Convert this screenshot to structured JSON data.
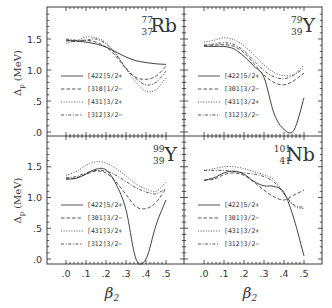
{
  "chart_data": [
    {
      "type": "line",
      "panel": "top-left",
      "title": "77 37 Rb",
      "nucleus": {
        "mass": "77",
        "z": "37",
        "symbol": "Rb"
      },
      "xlabel": "β2",
      "ylabel": "Δp (MeV)",
      "xlim": [
        0.0,
        0.5
      ],
      "ylim": [
        0.0,
        1.5
      ],
      "x": [
        0.0,
        0.05,
        0.1,
        0.15,
        0.2,
        0.25,
        0.3,
        0.35,
        0.4,
        0.45,
        0.5
      ],
      "series": [
        {
          "name": "[422]5/2+",
          "style": "solid",
          "values": [
            1.48,
            1.47,
            1.45,
            1.42,
            1.37,
            1.29,
            1.21,
            1.15,
            1.12,
            1.1,
            1.09
          ]
        },
        {
          "name": "[310]1/2−",
          "style": "dashed",
          "values": [
            1.47,
            1.46,
            1.48,
            1.45,
            1.37,
            1.22,
            1.02,
            0.88,
            0.85,
            0.9,
            1.06
          ]
        },
        {
          "name": "[431]3/2+",
          "style": "dotted",
          "values": [
            1.43,
            1.47,
            1.53,
            1.52,
            1.44,
            1.26,
            1.02,
            0.8,
            0.66,
            0.68,
            0.88
          ]
        },
        {
          "name": "[312]3/2−",
          "style": "dashdot",
          "values": [
            1.5,
            1.48,
            1.48,
            1.5,
            1.42,
            1.25,
            1.03,
            0.86,
            0.76,
            0.8,
            0.98
          ]
        }
      ]
    },
    {
      "type": "line",
      "panel": "top-right",
      "title": "79 39 Y",
      "nucleus": {
        "mass": "79",
        "z": "39",
        "symbol": "Y"
      },
      "xlabel": "β2",
      "ylabel": "Δp (MeV)",
      "xlim": [
        0.0,
        0.5
      ],
      "ylim": [
        0.0,
        1.5
      ],
      "x": [
        0.0,
        0.05,
        0.1,
        0.15,
        0.2,
        0.25,
        0.3,
        0.35,
        0.4,
        0.45,
        0.5
      ],
      "series": [
        {
          "name": "[422]5/2+",
          "style": "solid",
          "values": [
            1.38,
            1.38,
            1.38,
            1.34,
            1.22,
            1.06,
            0.88,
            0.3,
            0.04,
            0.03,
            0.55
          ]
        },
        {
          "name": "[301]3/2−",
          "style": "dashed",
          "values": [
            1.4,
            1.4,
            1.41,
            1.38,
            1.28,
            1.1,
            0.92,
            0.8,
            0.76,
            0.83,
            0.95
          ]
        },
        {
          "name": "[431]3/2+",
          "style": "dotted",
          "values": [
            1.45,
            1.48,
            1.52,
            1.49,
            1.39,
            1.24,
            1.08,
            0.96,
            0.91,
            0.93,
            1.08
          ]
        },
        {
          "name": "[312]3/2−",
          "style": "dashdot",
          "values": [
            1.4,
            1.42,
            1.44,
            1.41,
            1.31,
            1.15,
            0.99,
            0.89,
            0.86,
            0.92,
            1.03
          ]
        }
      ]
    },
    {
      "type": "line",
      "panel": "bottom-left",
      "title": "99 39 Y",
      "nucleus": {
        "mass": "99",
        "z": "39",
        "symbol": "Y"
      },
      "xlabel": "β2",
      "ylabel": "Δp (MeV)",
      "xlim": [
        0.0,
        0.5
      ],
      "ylim": [
        0.0,
        1.5
      ],
      "x": [
        0.0,
        0.05,
        0.1,
        0.15,
        0.2,
        0.25,
        0.3,
        0.35,
        0.4,
        0.45,
        0.5
      ],
      "series": [
        {
          "name": "[422]5/2+",
          "style": "solid",
          "values": [
            1.3,
            1.31,
            1.38,
            1.46,
            1.45,
            1.22,
            0.8,
            0.0,
            0.0,
            0.55,
            0.96
          ]
        },
        {
          "name": "[301]3/2−",
          "style": "dashed",
          "values": [
            1.3,
            1.32,
            1.38,
            1.43,
            1.4,
            1.25,
            1.05,
            0.85,
            0.82,
            0.92,
            1.15
          ]
        },
        {
          "name": "[431]3/2+",
          "style": "dotted",
          "values": [
            1.36,
            1.42,
            1.52,
            1.58,
            1.56,
            1.47,
            1.35,
            1.22,
            1.14,
            1.1,
            1.25
          ]
        },
        {
          "name": "[312]3/2−",
          "style": "dashdot",
          "values": [
            1.32,
            1.34,
            1.4,
            1.44,
            1.43,
            1.36,
            1.26,
            1.16,
            1.09,
            1.06,
            1.15
          ]
        }
      ]
    },
    {
      "type": "line",
      "panel": "bottom-right",
      "title": "101 41 Nb",
      "nucleus": {
        "mass": "101",
        "z": "41",
        "symbol": "Nb"
      },
      "xlabel": "β2",
      "ylabel": "Δp (MeV)",
      "xlim": [
        0.0,
        0.5
      ],
      "ylim": [
        0.0,
        1.5
      ],
      "x": [
        0.0,
        0.05,
        0.1,
        0.15,
        0.2,
        0.25,
        0.3,
        0.35,
        0.4,
        0.45,
        0.5
      ],
      "series": [
        {
          "name": "[422]5/2+",
          "style": "solid",
          "values": [
            1.28,
            1.32,
            1.4,
            1.43,
            1.38,
            1.26,
            1.19,
            1.18,
            1.08,
            0.65,
            0.05
          ]
        },
        {
          "name": "[301]3/2−",
          "style": "dashed",
          "values": [
            1.28,
            1.3,
            1.37,
            1.4,
            1.36,
            1.25,
            1.12,
            1.01,
            0.96,
            1.04,
            1.12
          ]
        },
        {
          "name": "[431]3/2+",
          "style": "dotted",
          "values": [
            1.44,
            1.47,
            1.5,
            1.5,
            1.47,
            1.42,
            1.37,
            1.29,
            1.06,
            0.86,
            0.82
          ]
        },
        {
          "name": "[312]3/2−",
          "style": "dashdot",
          "values": [
            1.44,
            1.44,
            1.44,
            1.42,
            1.4,
            1.38,
            1.34,
            1.25,
            1.06,
            0.88,
            0.84
          ]
        }
      ]
    }
  ],
  "axes": {
    "y_tick_labels": [
      "1.5",
      "1.0",
      ".5",
      ".0"
    ],
    "x_tick_labels": [
      ".0",
      ".1",
      ".2",
      ".3",
      ".4",
      ".5"
    ],
    "y_title_delta": "Δ",
    "y_title_sub": "p",
    "y_title_unit": "(MeV)",
    "x_title": "β",
    "x_title_sub": "2"
  },
  "colors": {
    "ink": "#2b2b2b",
    "frame": "#3a3a3a",
    "background": "#ffffff"
  }
}
